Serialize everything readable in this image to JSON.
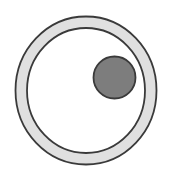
{
  "figure": {
    "name": "annulus-with-offset-disc",
    "canvas": {
      "width": 172,
      "height": 181,
      "background": "#ffffff"
    },
    "shapes": {
      "outer_ring": {
        "label": "outer-ring",
        "type": "annulus",
        "center_x": 86,
        "center_y": 90.5,
        "outer_radius_x": 70.5,
        "outer_radius_y": 74,
        "band_thickness": 11.5,
        "fill": "#e0e0e0",
        "stroke": "#3a3a3a",
        "stroke_width": 1.8
      },
      "inner_disc": {
        "label": "inner-disc",
        "type": "circle",
        "center_x": 114.5,
        "center_y": 77.5,
        "radius": 21,
        "fill": "#7d7d7d",
        "stroke": "#3a3a3a",
        "stroke_width": 1.8
      }
    }
  }
}
